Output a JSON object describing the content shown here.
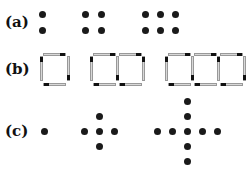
{
  "rows": [
    {
      "label": "(a)",
      "description": "Dot rectangles: 2x1, 2x2, 2x3 arrays"
    },
    {
      "label": "(b)",
      "description": "Matchstick squares in a row: 1, 2, 3 squares"
    },
    {
      "label": "(c)",
      "description": "Dot crosses: 1, 5, 9 dots"
    }
  ],
  "colors": {
    "dot": "#1a1a1a",
    "stick": "#d8d8d8",
    "stick_head": "#111111"
  }
}
